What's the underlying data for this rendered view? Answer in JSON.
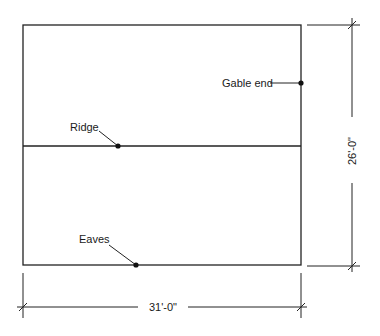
{
  "diagram": {
    "type": "roof-plan",
    "labels": {
      "gable_end": "Gable end",
      "ridge": "Ridge",
      "eaves": "Eaves"
    },
    "dimensions": {
      "height": "26'-0\"",
      "width": "31'-0\""
    },
    "colors": {
      "line": "#222222",
      "background": "#ffffff"
    }
  }
}
